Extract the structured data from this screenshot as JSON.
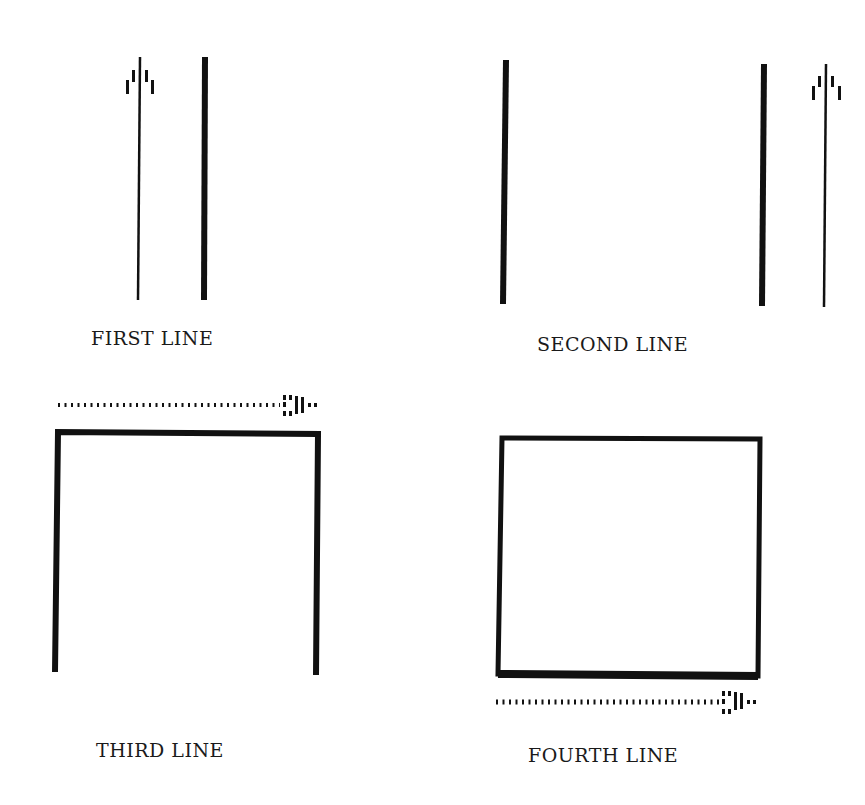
{
  "diagram": {
    "panels": [
      {
        "id": "first",
        "label": "FIRST LINE",
        "description": "Thin vertical line with upward arrow to the left of a thick vertical line"
      },
      {
        "id": "second",
        "label": "SECOND LINE",
        "description": "Thick vertical line on left, thick vertical line on right with thin line and upward arrow beside it"
      },
      {
        "id": "third",
        "label": "THIRD LINE",
        "description": "Open-bottom box (top and two sides) with dotted rightward arrow above top edge"
      },
      {
        "id": "fourth",
        "label": "FOURTH LINE",
        "description": "Closed box with emphasized bottom edge and dotted rightward arrow below"
      }
    ],
    "colors": {
      "ink": "#111111",
      "background": "#ffffff"
    }
  }
}
